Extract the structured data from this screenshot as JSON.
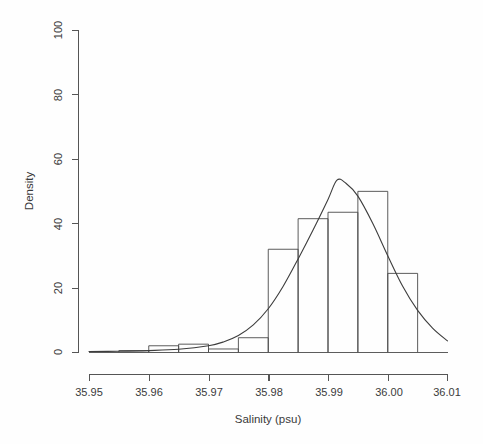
{
  "figure": {
    "background_color": "#fefefe",
    "line_color": "#4a4a4a",
    "text_color": "#3a3a3a"
  },
  "axes": {
    "x_title": "Salinity (psu)",
    "y_title": "Density"
  },
  "chart_data": {
    "type": "bar",
    "title": "",
    "subtitle": "",
    "xlabel": "Salinity (psu)",
    "ylabel": "Density",
    "xlim": [
      35.95,
      36.01
    ],
    "ylim": [
      0,
      100
    ],
    "grid": false,
    "legend": null,
    "x_ticks": [
      35.95,
      35.96,
      35.97,
      35.98,
      35.99,
      36.0,
      36.01
    ],
    "x_tick_labels": [
      "35.95",
      "35.96",
      "35.97",
      "35.98",
      "35.99",
      "36.00",
      "36.01"
    ],
    "y_ticks": [
      0,
      20,
      40,
      60,
      80,
      100
    ],
    "y_tick_labels": [
      "0",
      "20",
      "40",
      "60",
      "80",
      "100"
    ],
    "bin_width": 0.005,
    "bin_edges": [
      35.955,
      35.96,
      35.965,
      35.97,
      35.975,
      35.98,
      35.985,
      35.99,
      35.995,
      36.0,
      36.005
    ],
    "categories": [
      "35.955-35.960",
      "35.960-35.965",
      "35.965-35.970",
      "35.970-35.975",
      "35.975-35.980",
      "35.980-35.985",
      "35.985-35.990",
      "35.990-35.995",
      "35.995-36.000",
      "36.000-36.005"
    ],
    "values": [
      0.5,
      2.0,
      2.5,
      1.0,
      4.5,
      32.0,
      41.5,
      43.5,
      50.0,
      24.5
    ],
    "overlay": {
      "type": "line",
      "name": "density-curve",
      "peak_x": 35.9915,
      "peak_y": 53.5,
      "x": [
        35.95,
        35.955,
        35.96,
        35.965,
        35.97,
        35.9725,
        35.975,
        35.9775,
        35.98,
        35.9825,
        35.985,
        35.9875,
        35.99,
        35.9915,
        35.993,
        35.995,
        35.9975,
        36.0,
        36.0025,
        36.005,
        36.0075,
        36.01
      ],
      "y": [
        0.2,
        0.3,
        0.5,
        0.9,
        2.0,
        3.2,
        5.2,
        8.5,
        13.5,
        20.5,
        29.0,
        38.0,
        47.5,
        53.5,
        52.5,
        48.5,
        40.0,
        30.0,
        20.5,
        13.0,
        7.5,
        3.5
      ]
    }
  }
}
